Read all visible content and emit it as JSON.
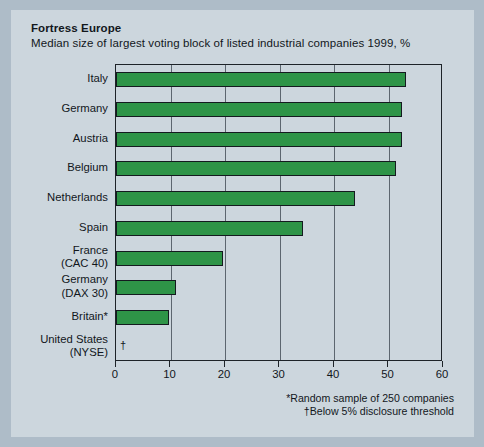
{
  "figure": {
    "title": "Fortress Europe",
    "subtitle": "Median size of largest voting block of listed industrial companies 1999, %",
    "footnotes": [
      "*Random sample of 250 companies",
      "†Below 5% disclosure threshold"
    ],
    "no_data_marker": "†",
    "colors": {
      "bar": "#2e9447",
      "bar_outline": "#141a1f",
      "panel_background": "#ccd6dd",
      "outer_background": "#aebcc8",
      "gridline": "#5c666f",
      "text": "#12171c"
    }
  },
  "chart_data": {
    "type": "bar",
    "orientation": "horizontal",
    "title": "Fortress Europe",
    "subtitle": "Median size of largest voting block of listed industrial companies 1999, %",
    "xlabel": "",
    "ylabel": "",
    "xlim": [
      0,
      60
    ],
    "ylim": null,
    "grid": true,
    "legend": null,
    "xticks": [
      0,
      10,
      20,
      30,
      40,
      50,
      60
    ],
    "xticklabels": [
      "0",
      "10",
      "20",
      "30",
      "40",
      "50",
      "60"
    ],
    "categories": [
      "Italy",
      "Germany",
      "Austria",
      "Belgium",
      "Netherlands",
      "Spain",
      "France (CAC 40)",
      "Germany (DAX 30)",
      "Britain*",
      "United States (NYSE)"
    ],
    "category_lines": [
      [
        "Italy"
      ],
      [
        "Germany"
      ],
      [
        "Austria"
      ],
      [
        "Belgium"
      ],
      [
        "Netherlands"
      ],
      [
        "Spain"
      ],
      [
        "France",
        "(CAC 40)"
      ],
      [
        "Germany",
        "(DAX 30)"
      ],
      [
        "Britain*"
      ],
      [
        "United States",
        "(NYSE)"
      ]
    ],
    "values": [
      53.3,
      52.5,
      52.4,
      51.4,
      43.9,
      34.3,
      19.6,
      11.0,
      9.7,
      null
    ],
    "value_labels": [
      "53",
      "52",
      "52",
      "51",
      "44",
      "34",
      "20",
      "11",
      "10",
      "†"
    ]
  }
}
